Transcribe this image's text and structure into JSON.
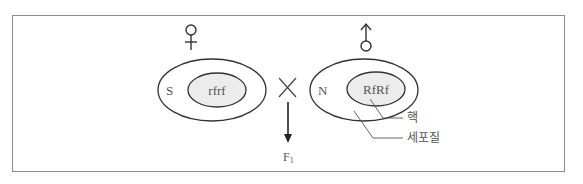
{
  "diagram": {
    "female": {
      "symbol": "♀",
      "cytoplasm_label": "S",
      "nucleus_genotype": "rfrf"
    },
    "male": {
      "symbol": "♂",
      "cytoplasm_label": "N",
      "nucleus_genotype": "RfRf"
    },
    "cross_symbol": "×",
    "offspring_label": "F",
    "offspring_subscript": "1",
    "annotations": {
      "nucleus": "핵",
      "cytoplasm": "세포질"
    },
    "colors": {
      "stroke": "#333333",
      "nucleus_fill": "#ececec",
      "text": "#555555",
      "frame": "#8a8a8a"
    }
  }
}
